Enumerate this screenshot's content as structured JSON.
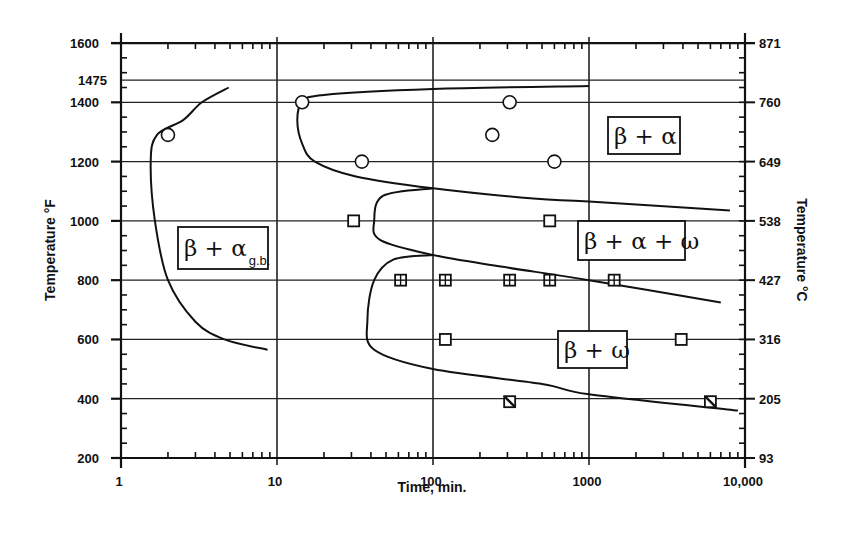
{
  "chart_data": {
    "type": "line",
    "title": "",
    "xlabel": "Time, min.",
    "ylabel": "Temperature °F",
    "ylabel_right": "Temperature °C",
    "xscale": "log",
    "xlim": [
      1,
      10000
    ],
    "ylim": [
      200,
      1600
    ],
    "grid": true,
    "x_tick_labels": [
      "1",
      "10",
      "100",
      "1000",
      "10,000"
    ],
    "y_tick_labels": [
      "200",
      "400",
      "600",
      "800",
      "1000",
      "1200",
      "1400",
      "1475",
      "1600"
    ],
    "y_right_tick_labels": [
      "93",
      "205",
      "316",
      "427",
      "538",
      "649",
      "760",
      "871"
    ],
    "regions": [
      {
        "name": "beta_alpha_gb",
        "label": "β + α",
        "subscript": "g.b."
      },
      {
        "name": "beta_alpha",
        "label": "β + α",
        "subscript": ""
      },
      {
        "name": "beta_alpha_omega",
        "label": "β + α + ω",
        "subscript": ""
      },
      {
        "name": "beta_omega",
        "label": "β + ω",
        "subscript": ""
      }
    ],
    "curves": [
      {
        "name": "alpha_gb_boundary",
        "points": [
          [
            4.9,
            1450
          ],
          [
            3.3,
            1400
          ],
          [
            2.5,
            1340
          ],
          [
            1.7,
            1290
          ],
          [
            1.55,
            1200
          ],
          [
            1.65,
            1000
          ],
          [
            2.0,
            800
          ],
          [
            3.0,
            660
          ],
          [
            4.6,
            600
          ],
          [
            8.7,
            565
          ]
        ]
      },
      {
        "name": "alpha_upper_boundary",
        "points": [
          [
            1000,
            1455
          ],
          [
            100,
            1445
          ],
          [
            20,
            1425
          ],
          [
            14.5,
            1400
          ],
          [
            13.5,
            1340
          ],
          [
            14.5,
            1260
          ],
          [
            17.5,
            1200
          ],
          [
            32,
            1150
          ],
          [
            100,
            1110
          ],
          [
            440,
            1075
          ],
          [
            1000,
            1065
          ],
          [
            8000,
            1035
          ]
        ]
      },
      {
        "name": "omega_upper_boundary",
        "points": [
          [
            100,
            1110
          ],
          [
            48,
            1085
          ],
          [
            42,
            1000
          ],
          [
            46,
            935
          ],
          [
            100,
            885
          ],
          [
            280,
            845
          ],
          [
            1000,
            800
          ],
          [
            7000,
            725
          ]
        ]
      },
      {
        "name": "omega_lower_boundary",
        "points": [
          [
            100,
            885
          ],
          [
            56,
            870
          ],
          [
            42,
            800
          ],
          [
            38,
            665
          ],
          [
            42,
            565
          ],
          [
            100,
            500
          ],
          [
            500,
            450
          ],
          [
            1000,
            415
          ],
          [
            9000,
            360
          ]
        ]
      }
    ],
    "series": [
      {
        "name": "beta+alpha observed (circle)",
        "marker": "circle",
        "points": [
          [
            2.0,
            1290
          ],
          [
            14.5,
            1400
          ],
          [
            35,
            1200
          ],
          [
            310,
            1400
          ],
          [
            240,
            1290
          ],
          [
            600,
            1200
          ]
        ]
      },
      {
        "name": "beta+alpha+omega / isothermal (open square)",
        "marker": "square",
        "points": [
          [
            31,
            1000
          ],
          [
            560,
            1000
          ],
          [
            120,
            600
          ],
          [
            3900,
            600
          ]
        ]
      },
      {
        "name": "omega (crossed square)",
        "marker": "square-cross",
        "points": [
          [
            62,
            800
          ],
          [
            120,
            800
          ],
          [
            310,
            800
          ],
          [
            560,
            800
          ],
          [
            1450,
            800
          ]
        ]
      },
      {
        "name": "omega (slashed square)",
        "marker": "square-slash",
        "points": [
          [
            310,
            390
          ],
          [
            6000,
            390
          ]
        ]
      }
    ],
    "reference_lines_F": [
      1475
    ]
  }
}
